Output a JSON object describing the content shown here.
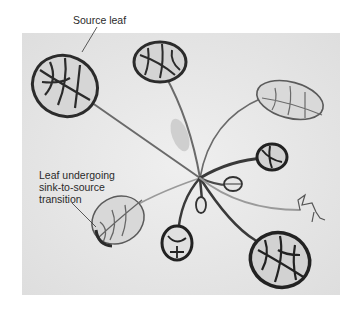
{
  "figure": {
    "labels": {
      "source_leaf": "Source leaf",
      "transition_leaf_line1": "Leaf undergoing",
      "transition_leaf_line2": "sink-to-source",
      "transition_leaf_line3": "transition"
    },
    "colors": {
      "background": "#e9e9e9",
      "vein_dark": "#2b2b2b",
      "vein_light": "#8a8a8a"
    }
  }
}
